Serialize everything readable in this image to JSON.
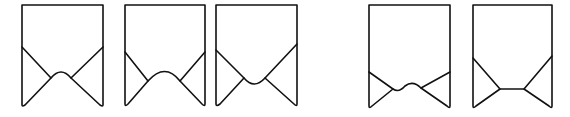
{
  "figure": {
    "stroke_color": "#111111",
    "background": "#ffffff",
    "shapes": [
      {
        "id": 1,
        "notch": "pointed-arch",
        "left": 22,
        "right": 103,
        "top": 5,
        "side_y": 47,
        "bottom": 105,
        "paths": {
          "outline": "M22,105 L22,5 L103,5 L103,105 Q103,107 100,105 L71,78 Q61,66 51,78 L25,105 Q22,107 22,105 Z",
          "left_flap": "M22,47 L51,78",
          "right_flap": "M103,47 L71,78"
        }
      },
      {
        "id": 2,
        "notch": "wide-round-arch",
        "left": 125,
        "right": 205,
        "top": 5,
        "side_y": 52,
        "bottom": 105,
        "paths": {
          "outline": "M125,104 L125,5 L205,5 L205,104 Q205,107 202,104 L180,81 Q165,62 148,81 L128,104 Q125,107 125,104 Z",
          "left_flap": "M125,52 L148,81",
          "right_flap": "M205,52 L180,81"
        }
      },
      {
        "id": 3,
        "notch": "inverted-round",
        "left": 216,
        "right": 297,
        "top": 5,
        "side_y": 50,
        "bottom": 106,
        "paths": {
          "outline": "M216,104 L216,5 L297,5 L297,104 Q297,107 294,104 L265,78 Q254,90 244,78 L220,104 Q216,107 216,104 Z",
          "left_flap": "M216,50 L244,78",
          "right_flap": "M297,44 L265,78"
        }
      },
      {
        "id": 4,
        "notch": "wavy",
        "left": 369,
        "right": 450,
        "top": 5,
        "side_y": 72,
        "bottom": 108,
        "paths": {
          "outline": "M369,106 L369,5 L450,5 L450,106 Q450,109 447,106 L421,88 Q413,80 405,86 Q399,93 393,89 L372,106 Q369,109 369,106 Z",
          "left_flap": "M369,72 L393,89",
          "right_flap": "M450,72 L421,88"
        }
      },
      {
        "id": 5,
        "notch": "flat",
        "left": 473,
        "right": 552,
        "top": 5,
        "side_y": 58,
        "bottom": 108,
        "paths": {
          "outline": "M473,106 L473,5 L552,5 L552,106 Q552,109 549,106 L524,89 L500,89 L476,106 Q473,109 473,106 Z",
          "left_flap": "M473,58 L500,89",
          "right_flap": "M552,56 L524,89"
        }
      }
    ]
  }
}
